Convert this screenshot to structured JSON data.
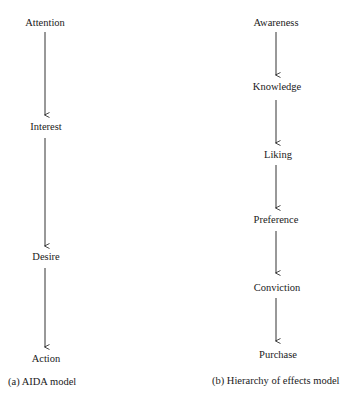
{
  "diagram_a": {
    "caption": "(a) AIDA model",
    "nodes": [
      {
        "label": "Attention"
      },
      {
        "label": "Interest"
      },
      {
        "label": "Desire"
      },
      {
        "label": "Action"
      }
    ]
  },
  "diagram_b": {
    "caption": "(b) Hierarchy of effects model",
    "nodes": [
      {
        "label": "Awareness"
      },
      {
        "label": "Knowledge"
      },
      {
        "label": "Liking"
      },
      {
        "label": "Preference"
      },
      {
        "label": "Conviction"
      },
      {
        "label": "Purchase"
      }
    ]
  },
  "colors": {
    "line": "#333333",
    "text": "#1a1a1a",
    "background": "#ffffff"
  }
}
